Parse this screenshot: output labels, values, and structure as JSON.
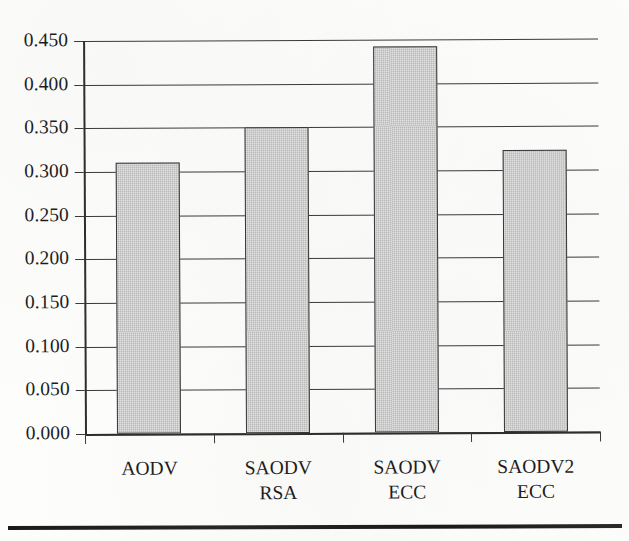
{
  "chart_data": {
    "type": "bar",
    "title": "",
    "subtitle": "",
    "xlabel": "",
    "ylabel": "",
    "categories": [
      "AODV",
      "SAODV RSA",
      "SAODV ECC",
      "SAODV2 ECC"
    ],
    "category_lines": [
      [
        "AODV",
        ""
      ],
      [
        "SAODV",
        "RSA"
      ],
      [
        "SAODV",
        "ECC"
      ],
      [
        "SAODV2",
        "ECC"
      ]
    ],
    "values": [
      0.31,
      0.35,
      0.442,
      0.323
    ],
    "series": [
      {
        "name": "",
        "values": [
          0.31,
          0.35,
          0.442,
          0.323
        ]
      }
    ],
    "ylim": [
      0.0,
      0.45
    ],
    "ytick_values": [
      0.0,
      0.05,
      0.1,
      0.15,
      0.2,
      0.25,
      0.3,
      0.35,
      0.4,
      0.45
    ],
    "ytick_labels": [
      "0.000",
      "0.050",
      "0.100",
      "0.150",
      "0.200",
      "0.250",
      "0.300",
      "0.350",
      "0.400",
      "0.450"
    ],
    "grid": true,
    "grid_axis": "y",
    "legend": false,
    "legend_position": "none",
    "bar_fill_color": "#c3c3c3",
    "bar_edge_color": "#373737",
    "axis_color": "#2e2e2e",
    "grid_color": "#3a3a3a",
    "background_color": "#fdfdfc",
    "annotations": []
  },
  "figure": {
    "bottom_rule_color": "#1b1b1b"
  }
}
